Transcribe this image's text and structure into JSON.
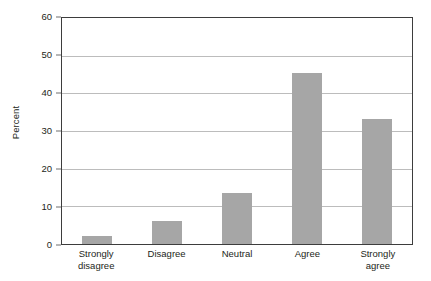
{
  "chart_data": {
    "type": "bar",
    "title": "",
    "subtitle": "",
    "xlabel": "",
    "ylabel": "Percent",
    "categories": [
      "Strongly disagree",
      "Disagree",
      "Neutral",
      "Agree",
      "Strongly agree"
    ],
    "category_lines": [
      [
        "Strongly",
        "disagree"
      ],
      [
        "Disagree",
        ""
      ],
      [
        "Neutral",
        ""
      ],
      [
        "Agree",
        ""
      ],
      [
        "Strongly",
        "agree"
      ]
    ],
    "values": [
      2,
      6,
      13.5,
      45,
      33
    ],
    "ylim": [
      0,
      60
    ],
    "yticks": [
      0,
      10,
      20,
      30,
      40,
      50,
      60
    ],
    "ytick_labels": [
      "0",
      "10",
      "20",
      "30",
      "40",
      "50",
      "60"
    ],
    "grid": true,
    "grid_axis": "y",
    "legend": false,
    "legend_position": "none",
    "bar_color": "#a6a6a6",
    "grid_color": "#bcbcbc",
    "axis_color": "#3d3d3d",
    "text_color": "#231f20",
    "background": "#ffffff"
  }
}
